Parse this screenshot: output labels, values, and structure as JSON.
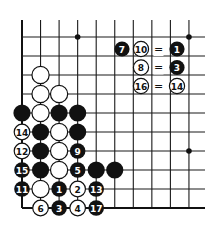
{
  "diagram": {
    "type": "go-board-fragment",
    "colors": {
      "black": "#111111",
      "white": "#ffffff",
      "line": "#1a1a1a"
    },
    "grid": {
      "columns": 10,
      "rows": 10,
      "edges": [
        "left",
        "bottom"
      ]
    },
    "star_points": [
      {
        "col": 3,
        "row": 0
      },
      {
        "col": 9,
        "row": 0
      },
      {
        "col": 9,
        "row": 6
      }
    ],
    "stones": [
      {
        "col": 1,
        "row": 2,
        "color": "white",
        "label": ""
      },
      {
        "col": 1,
        "row": 3,
        "color": "white",
        "label": ""
      },
      {
        "col": 2,
        "row": 3,
        "color": "white",
        "label": ""
      },
      {
        "col": 0,
        "row": 4,
        "color": "black",
        "label": ""
      },
      {
        "col": 1,
        "row": 4,
        "color": "white",
        "label": ""
      },
      {
        "col": 2,
        "row": 4,
        "color": "black",
        "label": ""
      },
      {
        "col": 3,
        "row": 4,
        "color": "black",
        "label": ""
      },
      {
        "col": 0,
        "row": 5,
        "color": "white",
        "label": "14"
      },
      {
        "col": 1,
        "row": 5,
        "color": "black",
        "label": ""
      },
      {
        "col": 2,
        "row": 5,
        "color": "white",
        "label": ""
      },
      {
        "col": 3,
        "row": 5,
        "color": "black",
        "label": ""
      },
      {
        "col": 0,
        "row": 6,
        "color": "white",
        "label": "12"
      },
      {
        "col": 1,
        "row": 6,
        "color": "black",
        "label": ""
      },
      {
        "col": 2,
        "row": 6,
        "color": "white",
        "label": ""
      },
      {
        "col": 3,
        "row": 6,
        "color": "black",
        "label": "9"
      },
      {
        "col": 0,
        "row": 7,
        "color": "black",
        "label": "15"
      },
      {
        "col": 1,
        "row": 7,
        "color": "black",
        "label": ""
      },
      {
        "col": 2,
        "row": 7,
        "color": "white",
        "label": ""
      },
      {
        "col": 3,
        "row": 7,
        "color": "black",
        "label": "5"
      },
      {
        "col": 4,
        "row": 7,
        "color": "black",
        "label": ""
      },
      {
        "col": 5,
        "row": 7,
        "color": "black",
        "label": ""
      },
      {
        "col": 0,
        "row": 8,
        "color": "black",
        "label": "11"
      },
      {
        "col": 1,
        "row": 8,
        "color": "white",
        "label": ""
      },
      {
        "col": 2,
        "row": 8,
        "color": "black",
        "label": "1"
      },
      {
        "col": 3,
        "row": 8,
        "color": "white",
        "label": "2"
      },
      {
        "col": 4,
        "row": 8,
        "color": "black",
        "label": "13"
      },
      {
        "col": 1,
        "row": 9,
        "color": "white",
        "label": "6"
      },
      {
        "col": 2,
        "row": 9,
        "color": "black",
        "label": "3"
      },
      {
        "col": 3,
        "row": 9,
        "color": "white",
        "label": "4"
      },
      {
        "col": 4,
        "row": 9,
        "color": "black",
        "label": "17"
      }
    ],
    "annotations": [
      {
        "items": [
          {
            "kind": "stone",
            "color": "black",
            "label": "7"
          },
          {
            "kind": "stone",
            "color": "white",
            "label": "10"
          },
          {
            "kind": "text",
            "label": "="
          },
          {
            "kind": "stone",
            "color": "black",
            "label": "1"
          }
        ]
      },
      {
        "items": [
          {
            "kind": "stone",
            "color": "white",
            "label": "8"
          },
          {
            "kind": "text",
            "label": "="
          },
          {
            "kind": "stone",
            "color": "black",
            "label": "3"
          }
        ]
      },
      {
        "items": [
          {
            "kind": "stone",
            "color": "white",
            "label": "16"
          },
          {
            "kind": "text",
            "label": "="
          },
          {
            "kind": "stone",
            "color": "white",
            "label": "14"
          }
        ]
      }
    ]
  }
}
